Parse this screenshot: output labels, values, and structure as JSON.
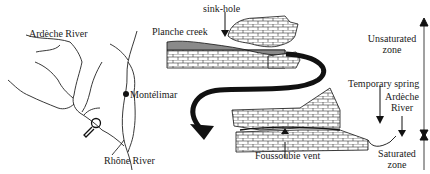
{
  "map": {
    "labels": {
      "ardeche_river": "Ardèche River",
      "montelimar": "Montélimar",
      "rhone_river": "Rhône River"
    },
    "icons": [
      "magnifier-icon",
      "city-dot-icon"
    ]
  },
  "cross_section": {
    "labels": {
      "sink_hole": "sink-hole",
      "planche_creek": "Planche creek",
      "temporary_spring": "Temporary spring",
      "ardeche_river_line1": "Ardèche",
      "ardeche_river_line2": "River",
      "foussoubie_vent": "Foussoubie vent",
      "unsaturated_zone_line1": "Unsaturated",
      "unsaturated_zone_line2": "zone",
      "saturated_zone_line1": "Saturated",
      "saturated_zone_line2": "zone"
    }
  },
  "colors": {
    "ink": "#111111",
    "limestone_fill": "#ffffff",
    "creek_fill": "#8a8a8a",
    "background": "#ffffff"
  }
}
